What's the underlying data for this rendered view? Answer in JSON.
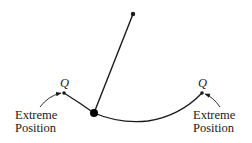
{
  "diagram": {
    "type": "pendulum",
    "pivot": {
      "x": 133,
      "y": 14
    },
    "bob": {
      "x": 94,
      "y": 113
    },
    "stroke_color": "#1a1a1a",
    "points": {
      "left": {
        "label": "Q",
        "x": 64,
        "y": 93
      },
      "right": {
        "label": "Q",
        "x": 202,
        "y": 93
      }
    },
    "labels": {
      "left": {
        "line1": "Extreme",
        "line2": "Position"
      },
      "right": {
        "line1": "Extreme",
        "line2": "Position"
      }
    }
  }
}
